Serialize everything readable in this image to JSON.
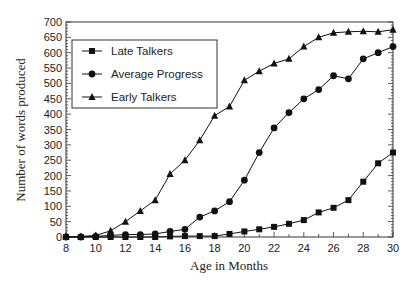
{
  "chart_data": {
    "type": "line",
    "title": "",
    "xlabel": "Age in Months",
    "ylabel": "Number of words produced",
    "xlim": [
      8,
      30
    ],
    "ylim": [
      0,
      700
    ],
    "x_ticks": [
      8,
      10,
      12,
      14,
      16,
      18,
      20,
      22,
      24,
      26,
      28,
      30
    ],
    "y_ticks": [
      0,
      50,
      100,
      150,
      200,
      250,
      300,
      350,
      400,
      450,
      500,
      550,
      600,
      650,
      700
    ],
    "grid": false,
    "legend_position": "upper left",
    "x": [
      8,
      9,
      10,
      11,
      12,
      13,
      14,
      15,
      16,
      17,
      18,
      19,
      20,
      21,
      22,
      23,
      24,
      25,
      26,
      27,
      28,
      29,
      30
    ],
    "series": [
      {
        "name": "Late Talkers",
        "marker": "square",
        "values": [
          0,
          0,
          0,
          0,
          0,
          0,
          0,
          2,
          3,
          3,
          3,
          10,
          18,
          25,
          33,
          43,
          55,
          80,
          95,
          120,
          180,
          240,
          275
        ]
      },
      {
        "name": "Average Progress",
        "marker": "circle",
        "values": [
          0,
          0,
          2,
          5,
          8,
          8,
          10,
          18,
          25,
          65,
          85,
          115,
          185,
          275,
          355,
          405,
          450,
          480,
          525,
          515,
          580,
          600,
          620
        ]
      },
      {
        "name": "Early Talkers",
        "marker": "triangle",
        "values": [
          0,
          2,
          5,
          20,
          50,
          85,
          120,
          205,
          250,
          315,
          395,
          425,
          510,
          540,
          565,
          580,
          620,
          650,
          665,
          668,
          670,
          668,
          675
        ]
      }
    ]
  }
}
